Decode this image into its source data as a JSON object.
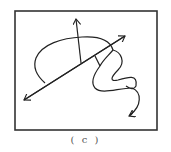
{
  "figure": {
    "caption": "( c )",
    "stroke_color": "#222222",
    "frame_color": "#333333",
    "background": "#ffffff"
  }
}
